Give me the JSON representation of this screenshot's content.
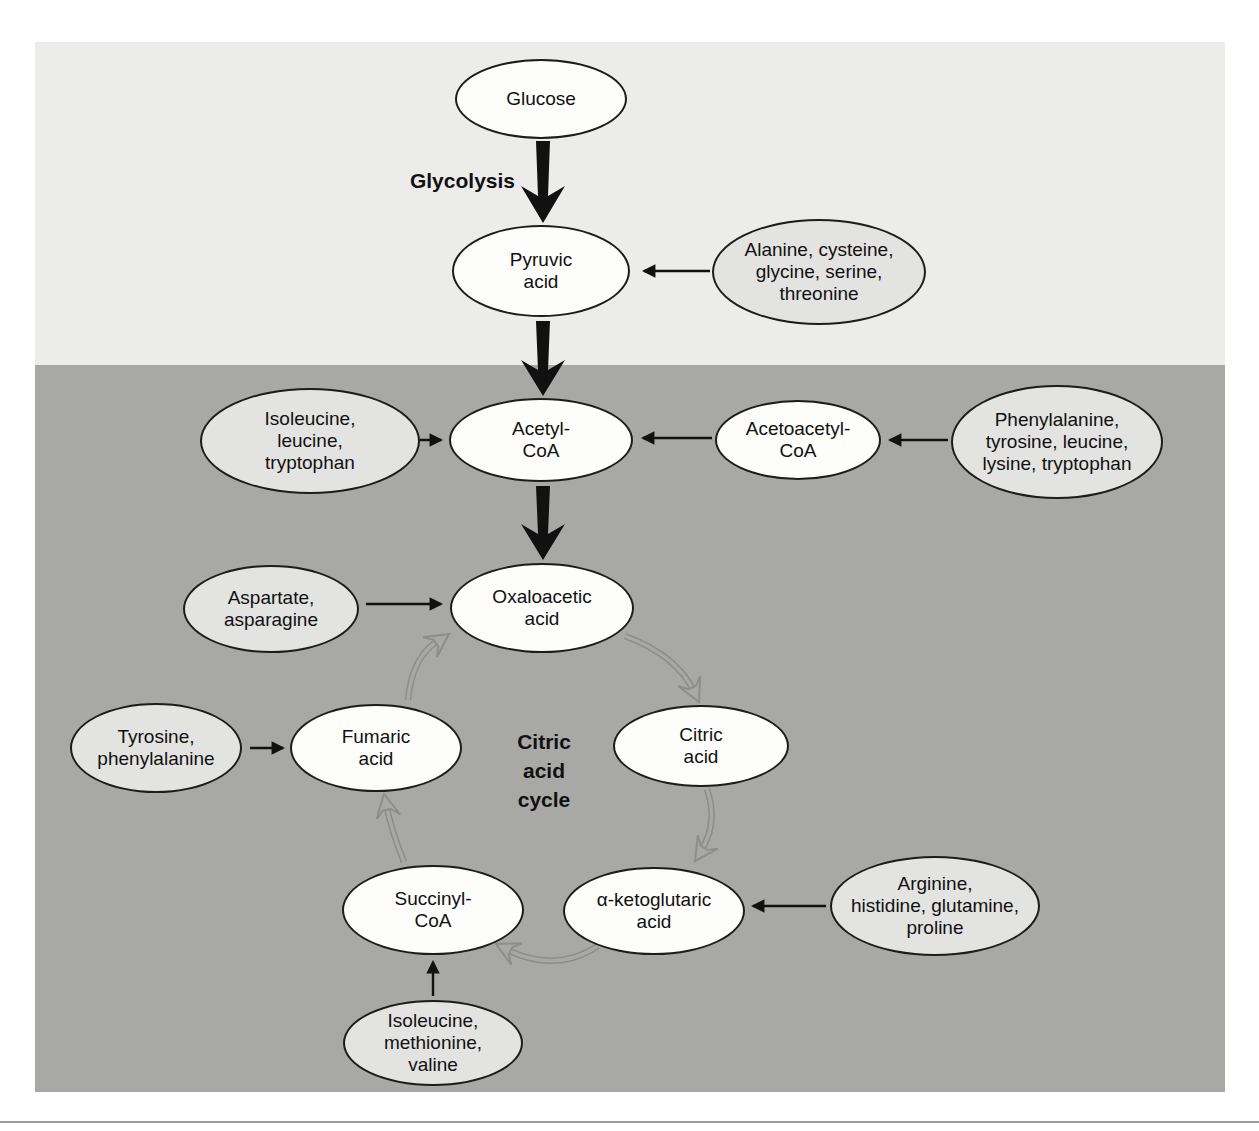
{
  "diagram_title": "Amino acid entry points into glycolysis and the citric acid cycle",
  "colors": {
    "page_background": "#ffffff",
    "top_section_background": "#ececea",
    "bottom_section_background": "#a8a8a6",
    "metabolite_fill": "#fdfdfc",
    "amino_group_fill": "#e3e3e1",
    "ellipse_stroke": "#1c1c1c",
    "cycle_arrow_gray": "#8d8d8d",
    "bottom_rule": "#9b9b99"
  },
  "labels": {
    "glycolysis": "Glycolysis",
    "citric_acid_cycle": "Citric\nacid\ncycle"
  },
  "nodes": {
    "glucose": {
      "label": "Glucose",
      "kind": "metabolite"
    },
    "pyruvic": {
      "label": "Pyruvic\nacid",
      "kind": "metabolite"
    },
    "alanine": {
      "label": "Alanine, cysteine,\nglycine, serine,\nthreonine",
      "kind": "amino-group"
    },
    "isoleucine": {
      "label": "Isoleucine,\nleucine,\ntryptophan",
      "kind": "amino-group"
    },
    "acetyl": {
      "label": "Acetyl-\nCoA",
      "kind": "metabolite"
    },
    "acetoacetyl": {
      "label": "Acetoacetyl-\nCoA",
      "kind": "metabolite"
    },
    "phenylalanine": {
      "label": "Phenylalanine,\ntyrosine, leucine,\nlysine, tryptophan",
      "kind": "amino-group"
    },
    "aspartate": {
      "label": "Aspartate,\nasparagine",
      "kind": "amino-group"
    },
    "oxaloacetic": {
      "label": "Oxaloacetic\nacid",
      "kind": "metabolite"
    },
    "tyrosine": {
      "label": "Tyrosine,\nphenylalanine",
      "kind": "amino-group"
    },
    "fumaric": {
      "label": "Fumaric\nacid",
      "kind": "metabolite"
    },
    "citric": {
      "label": "Citric\nacid",
      "kind": "metabolite"
    },
    "succinyl": {
      "label": "Succinyl-\nCoA",
      "kind": "metabolite"
    },
    "ketoglutaric": {
      "label": "α-ketoglutaric\nacid",
      "kind": "metabolite"
    },
    "arginine": {
      "label": "Arginine,\nhistidine, glutamine,\nproline",
      "kind": "amino-group"
    },
    "isomethval": {
      "label": "Isoleucine,\nmethionine,\nvaline",
      "kind": "amino-group"
    }
  },
  "edges": [
    {
      "from": "glucose",
      "to": "pyruvic",
      "style": "thick-black",
      "via_label": "Glycolysis"
    },
    {
      "from": "alanine",
      "to": "pyruvic",
      "style": "thin-black"
    },
    {
      "from": "pyruvic",
      "to": "acetyl",
      "style": "thick-black"
    },
    {
      "from": "isoleucine",
      "to": "acetyl",
      "style": "thin-black"
    },
    {
      "from": "acetoacetyl",
      "to": "acetyl",
      "style": "thin-black"
    },
    {
      "from": "phenylalanine",
      "to": "acetoacetyl",
      "style": "thin-black"
    },
    {
      "from": "acetyl",
      "to": "oxaloacetic",
      "style": "thick-black"
    },
    {
      "from": "aspartate",
      "to": "oxaloacetic",
      "style": "thin-black"
    },
    {
      "from": "tyrosine",
      "to": "fumaric",
      "style": "thin-black"
    },
    {
      "from": "arginine",
      "to": "ketoglutaric",
      "style": "thin-black"
    },
    {
      "from": "isomethval",
      "to": "succinyl",
      "style": "thin-black"
    },
    {
      "from": "oxaloacetic",
      "to": "citric",
      "style": "cycle-gray"
    },
    {
      "from": "citric",
      "to": "ketoglutaric",
      "style": "cycle-gray"
    },
    {
      "from": "ketoglutaric",
      "to": "succinyl",
      "style": "cycle-gray"
    },
    {
      "from": "succinyl",
      "to": "fumaric",
      "style": "cycle-gray"
    },
    {
      "from": "fumaric",
      "to": "oxaloacetic",
      "style": "cycle-gray"
    }
  ]
}
